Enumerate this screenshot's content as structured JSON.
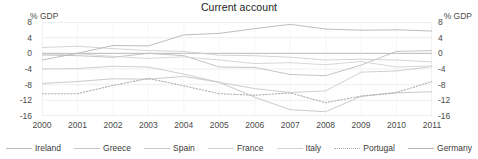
{
  "chart_data": {
    "type": "line",
    "title": "Current account",
    "xlabel": "",
    "ylabel": "% GDP",
    "ylabel_right": "% GDP",
    "ylim": [
      -16,
      8
    ],
    "yticks": [
      8,
      4,
      0,
      -4,
      -8,
      -12,
      -16
    ],
    "ytick_labels": [
      "8",
      "4",
      "0",
      "-4",
      "-8",
      "-12",
      "-16"
    ],
    "ytick_labels_right": [
      "8",
      "4",
      "0",
      "-4",
      "-8",
      "-12",
      "-16"
    ],
    "grid": true,
    "legend_position": "bottom",
    "x": [
      2000,
      2001,
      2002,
      2003,
      2004,
      2005,
      2006,
      2007,
      2008,
      2009,
      2010,
      2011
    ],
    "xtick_labels": [
      "2000",
      "2001",
      "2002",
      "2003",
      "2004",
      "2005",
      "2006",
      "2007",
      "2008",
      "2009",
      "2010",
      "2011"
    ],
    "series": [
      {
        "name": "Ireland",
        "style": "solid",
        "color": "#bdbdbd",
        "values": [
          -0.4,
          -0.6,
          -1.0,
          0.0,
          -0.6,
          -3.5,
          -3.6,
          -5.4,
          -5.7,
          -3.0,
          0.5,
          0.7
        ]
      },
      {
        "name": "Greece",
        "style": "solid",
        "color": "#c4c4c4",
        "values": [
          -7.7,
          -7.2,
          -6.5,
          -6.6,
          -5.9,
          -7.4,
          -11.2,
          -14.4,
          -14.9,
          -11.0,
          -10.1,
          -9.8
        ]
      },
      {
        "name": "Spain",
        "style": "solid",
        "color": "#c9c9c9",
        "values": [
          -4.0,
          -3.9,
          -3.3,
          -3.5,
          -5.3,
          -7.4,
          -9.0,
          -10.0,
          -9.6,
          -4.8,
          -4.5,
          -3.4
        ]
      },
      {
        "name": "France",
        "style": "solid",
        "color": "#cfcfcf",
        "values": [
          1.5,
          1.8,
          1.2,
          0.7,
          0.5,
          -0.5,
          -0.6,
          -1.0,
          -1.7,
          -1.5,
          -1.7,
          -2.2
        ]
      },
      {
        "name": "Italy",
        "style": "solid",
        "color": "#d2d2d2",
        "values": [
          -0.5,
          -0.1,
          -0.8,
          -1.3,
          -0.9,
          -1.7,
          -2.6,
          -2.4,
          -2.9,
          -2.1,
          -3.5,
          -3.2
        ]
      },
      {
        "name": "Portugal",
        "style": "dotted",
        "color": "#b0b0b0",
        "values": [
          -10.3,
          -10.3,
          -8.2,
          -6.4,
          -8.3,
          -10.3,
          -10.7,
          -10.1,
          -12.6,
          -10.9,
          -10.0,
          -7.2
        ]
      },
      {
        "name": "Germany",
        "style": "solid",
        "color": "#b5b5b5",
        "values": [
          -1.7,
          0.0,
          2.0,
          1.9,
          4.7,
          5.1,
          6.3,
          7.4,
          6.2,
          5.9,
          6.0,
          5.7
        ]
      }
    ]
  },
  "legend": {
    "items": [
      {
        "label": "Ireland"
      },
      {
        "label": "Greece"
      },
      {
        "label": "Spain"
      },
      {
        "label": "France"
      },
      {
        "label": "Italy"
      },
      {
        "label": "Portugal"
      },
      {
        "label": "Germany"
      }
    ]
  }
}
